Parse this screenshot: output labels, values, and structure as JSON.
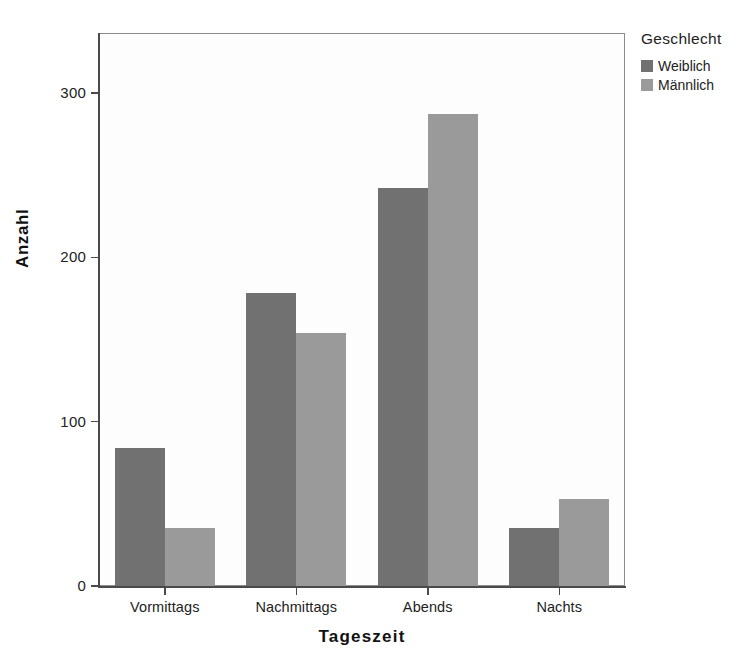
{
  "chart_data": {
    "type": "bar",
    "title": "",
    "subtitle": "",
    "xlabel": "Tageszeit",
    "ylabel": "Anzahl",
    "categories": [
      "Vormittags",
      "Nachmittags",
      "Abends",
      "Nachts"
    ],
    "series": [
      {
        "name": "Weiblich",
        "color": "#717171",
        "values": [
          84,
          178,
          242,
          35
        ]
      },
      {
        "name": "Männlich",
        "color": "#9a9a9a",
        "values": [
          35,
          154,
          287,
          53
        ]
      }
    ],
    "ylim": [
      0,
      337
    ],
    "yticks": [
      0,
      100,
      200,
      300
    ],
    "ytick_labels": [
      "0",
      "100",
      "200",
      "300"
    ],
    "grid": false,
    "legend": {
      "title": "Geschlecht",
      "position": "right-top",
      "entries": [
        "Weiblich",
        "Männlich"
      ]
    },
    "grouping": "grouped",
    "orientation": "vertical"
  }
}
